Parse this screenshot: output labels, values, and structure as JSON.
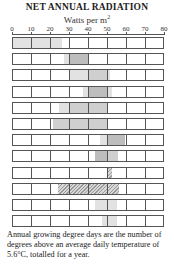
{
  "chart_data": {
    "type": "bar",
    "title": "NET ANNUAL RADIATION",
    "xlabel": "Watts per m²",
    "ylabel": "",
    "xlim": [
      0,
      80
    ],
    "x_ticks": [
      0,
      10,
      20,
      30,
      40,
      50,
      60,
      70,
      80
    ],
    "grid": true,
    "orientation": "horizontal range bars",
    "rows": [
      {
        "segments": [
          {
            "from": 0,
            "to": 26,
            "shade": "light"
          }
        ]
      },
      {
        "segments": [
          {
            "from": 27,
            "to": 30,
            "shade": "light"
          },
          {
            "from": 30,
            "to": 40,
            "shade": "dark"
          }
        ]
      },
      {
        "segments": [
          {
            "from": 30,
            "to": 40,
            "shade": "light"
          },
          {
            "from": 40,
            "to": 50,
            "shade": "mid"
          },
          {
            "from": 50,
            "to": 51,
            "shade": "light"
          }
        ]
      },
      {
        "segments": [
          {
            "from": 37,
            "to": 40,
            "shade": "light"
          },
          {
            "from": 40,
            "to": 50,
            "shade": "dark"
          },
          {
            "from": 50,
            "to": 52,
            "shade": "light"
          }
        ]
      },
      {
        "segments": [
          {
            "from": 24,
            "to": 30,
            "shade": "light"
          },
          {
            "from": 30,
            "to": 50,
            "shade": "mid"
          }
        ]
      },
      {
        "segments": [
          {
            "from": 21,
            "to": 50,
            "shade": "mid"
          }
        ]
      },
      {
        "segments": [
          {
            "from": 46,
            "to": 50,
            "shade": "light"
          },
          {
            "from": 50,
            "to": 59,
            "shade": "dark"
          }
        ]
      },
      {
        "segments": [
          {
            "from": 43,
            "to": 50,
            "shade": "dark"
          },
          {
            "from": 50,
            "to": 55,
            "shade": "mid"
          }
        ]
      },
      {
        "segments": [
          {
            "from": 50,
            "to": 52,
            "shade": "hatch"
          }
        ]
      },
      {
        "segments": [
          {
            "from": 23.5,
            "to": 56,
            "shade": "hatch"
          }
        ]
      },
      {
        "segments": [
          {
            "from": 43,
            "to": 55,
            "shade": "light"
          }
        ]
      },
      {
        "segments": [
          {
            "from": 47,
            "to": 55,
            "shade": "light"
          }
        ]
      }
    ],
    "legend": [],
    "annotations": [
      "Annual growing degree days are the number of degrees above an average daily temperature of 5.6°C, totalled for a year."
    ]
  },
  "header": {
    "title": "NET ANNUAL RADIATION",
    "subtitle": "Watts per m",
    "subtitle_sup": "2"
  },
  "axis": {
    "ticks": [
      "0",
      "10",
      "20",
      "30",
      "40",
      "50",
      "60",
      "70",
      "80"
    ]
  },
  "caption": "Annual growing degree days are the number of degrees above an average daily temperature of 5.6°C, totalled for a year.",
  "colors": {
    "grid": "#555555",
    "light": "#e2e2e2",
    "mid": "#cfcfcf",
    "dark": "#bdbdbd"
  }
}
